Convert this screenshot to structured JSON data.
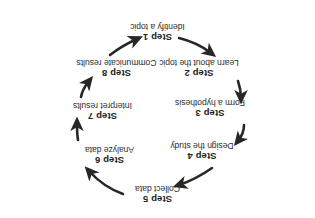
{
  "diagram": {
    "name": "research-process-cycle",
    "orientation": "rotated-180",
    "text_color": "#2b2b2b",
    "background_color": "#ffffff",
    "steps": [
      {
        "id": "step1",
        "title": "Step 1",
        "desc": "Identify a topic"
      },
      {
        "id": "step2",
        "title": "Step 2",
        "desc": "Learn about the topic"
      },
      {
        "id": "step3",
        "title": "Step 3",
        "desc": "Form a hypothesis"
      },
      {
        "id": "step4",
        "title": "Step 4",
        "desc": "Design the study"
      },
      {
        "id": "step5",
        "title": "Step 5",
        "desc": "Collect data"
      },
      {
        "id": "step6",
        "title": "Step 6",
        "desc": "Analyze data"
      },
      {
        "id": "step7",
        "title": "Step 7",
        "desc": "Interpret results"
      },
      {
        "id": "step8",
        "title": "Step 8",
        "desc": "Communicate results"
      }
    ],
    "arrows": [
      {
        "from": "step1",
        "to": "step2"
      },
      {
        "from": "step2",
        "to": "step3"
      },
      {
        "from": "step3",
        "to": "step4"
      },
      {
        "from": "step4",
        "to": "step5"
      },
      {
        "from": "step5",
        "to": "step6"
      },
      {
        "from": "step6",
        "to": "step7"
      },
      {
        "from": "step7",
        "to": "step8"
      },
      {
        "from": "step8",
        "to": "step1"
      }
    ]
  }
}
